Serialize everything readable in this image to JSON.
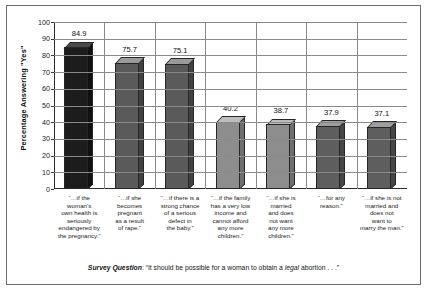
{
  "chart_data": {
    "type": "bar",
    "title": "",
    "subtitle": "",
    "xlabel": "",
    "ylabel": "Percentage Answering \"Yes\"",
    "ylim": [
      0,
      100
    ],
    "ytick_labels": [
      "100",
      "90",
      "80",
      "70",
      "60",
      "50",
      "40",
      "30",
      "20",
      "10",
      "0"
    ],
    "ytick_values": [
      100,
      90,
      80,
      70,
      60,
      50,
      40,
      30,
      20,
      10,
      0
    ],
    "grid": true,
    "legend": "none",
    "categories": [
      "“…if the woman’s own health is seriously endangered by the pregnancy.”",
      "“…if she becomes pregnant as a result of rape.”",
      "“…if there is a strong chance of a serious defect in the baby.”",
      "“…if the family has a very low income and cannot afford any more children.”",
      "“…if she is married and does not want any more children.”",
      "“…for any reason.”",
      "“…if she is not married and does not want to marry the man.”"
    ],
    "category_lines": [
      [
        "“…if the",
        "woman’s",
        "own health is",
        "seriously",
        "endangered by",
        "the pregnancy.”"
      ],
      [
        "“…if she",
        "becomes",
        "pregnant",
        "as a result",
        "of rape.”"
      ],
      [
        "“…if there is a",
        "strong chance",
        "of a serious",
        "defect in",
        "the baby.”"
      ],
      [
        "“…if the family",
        "has a very low",
        "income and",
        "cannot afford",
        "any more",
        "children.”"
      ],
      [
        "“…if she is",
        "married",
        "and does",
        "not want",
        "any more",
        "children.”"
      ],
      [
        "“…for any",
        "reason.”"
      ],
      [
        "“…if she is not",
        "married and",
        "does not",
        "want to",
        "marry the man.”"
      ]
    ],
    "values": [
      84.9,
      75.7,
      75.1,
      40.2,
      38.7,
      37.9,
      37.1
    ],
    "value_labels": [
      "84.9",
      "75.7",
      "75.1",
      "40.2",
      "38.7",
      "37.9",
      "37.1"
    ],
    "bar_colors": [
      "#1c1c1c",
      "#5a5a5a",
      "#5a5a5a",
      "#8d8d8d",
      "#8d8d8d",
      "#5e5e5e",
      "#5e5e5e"
    ],
    "bar_top_colors": [
      "#4a4a4a",
      "#9a9a9a",
      "#9a9a9a",
      "#bdbdbd",
      "#bdbdbd",
      "#9e9e9e",
      "#9e9e9e"
    ],
    "bar_side_colors": [
      "#101010",
      "#414141",
      "#414141",
      "#6e6e6e",
      "#6e6e6e",
      "#464646",
      "#464646"
    ]
  },
  "caption": {
    "lead": "Survey  Question",
    "body_before": ": “It should be possible for a woman to obtain a ",
    "emphasis": "legal",
    "body_after": " abortion . . .”"
  }
}
